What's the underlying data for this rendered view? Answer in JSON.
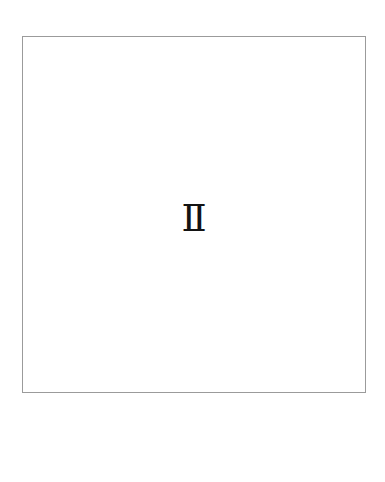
{
  "page": {
    "background_color": "#ffffff",
    "width": 385,
    "height": 482
  },
  "content_frame": {
    "border_color": "#9b9b9b",
    "border_width": 1,
    "fill_color": "#ffffff",
    "left": 22,
    "top": 36,
    "width": 344,
    "height": 357
  },
  "content": {
    "glyph": "Ⅱ",
    "glyph_name": "roman-numeral-two",
    "glyph_color": "#131313",
    "glyph_font_size": 37,
    "alignment": "center"
  }
}
